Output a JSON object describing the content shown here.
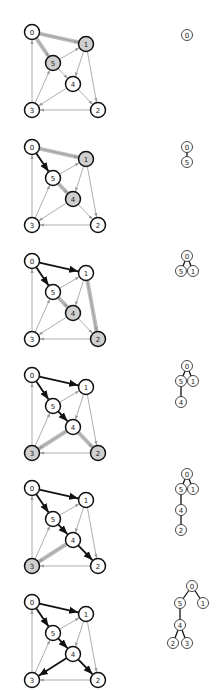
{
  "diagram": {
    "title": "",
    "type": "shortest-path-tree-construction",
    "colors": {
      "node_fill": "#ffffff",
      "node_highlight_fill": "#cfcfcf",
      "node_stroke": "#111111",
      "edge": "#999999",
      "edge_tree": "#111111",
      "edge_candidate": "#bdbdbd"
    },
    "nodes": [
      {
        "id": "0",
        "x": 32,
        "y": 32
      },
      {
        "id": "1",
        "x": 86,
        "y": 44
      },
      {
        "id": "2",
        "x": 98,
        "y": 110
      },
      {
        "id": "3",
        "x": 32,
        "y": 110
      },
      {
        "id": "4",
        "x": 73,
        "y": 84
      },
      {
        "id": "5",
        "x": 53,
        "y": 63
      }
    ],
    "edges": [
      {
        "from": "0",
        "to": "1"
      },
      {
        "from": "0",
        "to": "5"
      },
      {
        "from": "3",
        "to": "0"
      },
      {
        "from": "5",
        "to": "1"
      },
      {
        "from": "1",
        "to": "4"
      },
      {
        "from": "1",
        "to": "2"
      },
      {
        "from": "5",
        "to": "4"
      },
      {
        "from": "3",
        "to": "5"
      },
      {
        "from": "4",
        "to": "3"
      },
      {
        "from": "4",
        "to": "2"
      },
      {
        "from": "2",
        "to": "3"
      }
    ],
    "steps": [
      {
        "step": 1,
        "tree_edges": [],
        "candidate_edges": [
          [
            "0",
            "1"
          ],
          [
            "0",
            "5"
          ]
        ],
        "highlight_nodes": [
          "1",
          "5"
        ],
        "tree": {
          "nodes": [
            {
              "id": "0",
              "x": 187,
              "y": 35
            }
          ],
          "links": []
        }
      },
      {
        "step": 2,
        "tree_edges": [
          [
            "0",
            "5"
          ]
        ],
        "candidate_edges": [
          [
            "0",
            "1"
          ],
          [
            "5",
            "4"
          ]
        ],
        "highlight_nodes": [
          "1",
          "4"
        ],
        "tree": {
          "nodes": [
            {
              "id": "0",
              "x": 187,
              "y": 147
            },
            {
              "id": "5",
              "x": 187,
              "y": 162
            }
          ],
          "links": [
            [
              "0",
              "5"
            ]
          ]
        }
      },
      {
        "step": 3,
        "tree_edges": [
          [
            "0",
            "5"
          ],
          [
            "0",
            "1"
          ]
        ],
        "candidate_edges": [
          [
            "5",
            "4"
          ],
          [
            "1",
            "2"
          ]
        ],
        "highlight_nodes": [
          "4",
          "2"
        ],
        "tree": {
          "nodes": [
            {
              "id": "0",
              "x": 187,
              "y": 256
            },
            {
              "id": "5",
              "x": 181,
              "y": 271
            },
            {
              "id": "1",
              "x": 193,
              "y": 271
            }
          ],
          "links": [
            [
              "0",
              "5"
            ],
            [
              "0",
              "1"
            ]
          ]
        }
      },
      {
        "step": 4,
        "tree_edges": [
          [
            "0",
            "5"
          ],
          [
            "0",
            "1"
          ],
          [
            "5",
            "4"
          ]
        ],
        "candidate_edges": [
          [
            "4",
            "3"
          ],
          [
            "4",
            "2"
          ]
        ],
        "highlight_nodes": [
          "3",
          "2"
        ],
        "tree": {
          "nodes": [
            {
              "id": "0",
              "x": 187,
              "y": 366
            },
            {
              "id": "5",
              "x": 181,
              "y": 381
            },
            {
              "id": "1",
              "x": 193,
              "y": 381
            },
            {
              "id": "4",
              "x": 181,
              "y": 402
            }
          ],
          "links": [
            [
              "0",
              "5"
            ],
            [
              "0",
              "1"
            ],
            [
              "5",
              "4"
            ]
          ]
        }
      },
      {
        "step": 5,
        "tree_edges": [
          [
            "0",
            "5"
          ],
          [
            "0",
            "1"
          ],
          [
            "5",
            "4"
          ],
          [
            "4",
            "2"
          ]
        ],
        "candidate_edges": [
          [
            "4",
            "3"
          ]
        ],
        "highlight_nodes": [
          "3"
        ],
        "tree": {
          "nodes": [
            {
              "id": "0",
              "x": 187,
              "y": 474
            },
            {
              "id": "5",
              "x": 181,
              "y": 489
            },
            {
              "id": "1",
              "x": 193,
              "y": 489
            },
            {
              "id": "4",
              "x": 181,
              "y": 510
            },
            {
              "id": "2",
              "x": 181,
              "y": 530
            }
          ],
          "links": [
            [
              "0",
              "5"
            ],
            [
              "0",
              "1"
            ],
            [
              "5",
              "4"
            ],
            [
              "4",
              "2"
            ]
          ]
        }
      },
      {
        "step": 6,
        "tree_edges": [
          [
            "0",
            "5"
          ],
          [
            "0",
            "1"
          ],
          [
            "5",
            "4"
          ],
          [
            "4",
            "2"
          ],
          [
            "4",
            "3"
          ]
        ],
        "candidate_edges": [],
        "highlight_nodes": [],
        "tree": {
          "nodes": [
            {
              "id": "0",
              "x": 192,
              "y": 586
            },
            {
              "id": "5",
              "x": 180,
              "y": 603
            },
            {
              "id": "1",
              "x": 203,
              "y": 603
            },
            {
              "id": "4",
              "x": 180,
              "y": 625
            },
            {
              "id": "2",
              "x": 173,
              "y": 643
            },
            {
              "id": "3",
              "x": 187,
              "y": 643
            }
          ],
          "links": [
            [
              "0",
              "5"
            ],
            [
              "0",
              "1"
            ],
            [
              "5",
              "4"
            ],
            [
              "4",
              "2"
            ],
            [
              "4",
              "3"
            ]
          ]
        }
      }
    ],
    "panel_offsets_y": [
      0,
      115,
      229,
      343,
      456,
      570
    ]
  }
}
